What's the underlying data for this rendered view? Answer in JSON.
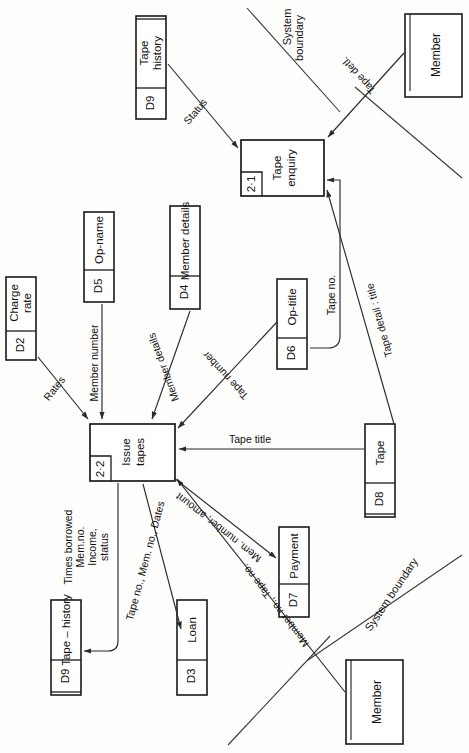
{
  "diagram": {
    "type": "data-flow-diagram",
    "orientation": "rotated-90-clockwise",
    "title": "",
    "colors": {
      "background": "#fdfdfc",
      "stroke": "#1a1a1a",
      "flow": "#2b2b2b",
      "text": "#111111"
    }
  },
  "processes": [
    {
      "id": "2·1",
      "name_line1": "Tape",
      "name_line2": "enquiry"
    },
    {
      "id": "2·2",
      "name_line1": "Issue",
      "name_line2": "tapes"
    }
  ],
  "data_stores": [
    {
      "id": "D9",
      "name_line1": "Tape",
      "name_line2": "history"
    },
    {
      "id": "D2",
      "name_line1": "Charge",
      "name_line2": "rate"
    },
    {
      "id": "D5",
      "name_line1": "Op-name",
      "name_line2": ""
    },
    {
      "id": "D4",
      "name_line1": "Member details",
      "name_line2": ""
    },
    {
      "id": "D6",
      "name_line1": "Op-title",
      "name_line2": ""
    },
    {
      "id": "D8",
      "name_line1": "Tape",
      "name_line2": ""
    },
    {
      "id": "D9",
      "name_line1": "Tape – history",
      "name_line2": ""
    },
    {
      "id": "D3",
      "name_line1": "Loan",
      "name_line2": ""
    },
    {
      "id": "D7",
      "name_line1": "Payment",
      "name_line2": ""
    }
  ],
  "external_entities": [
    {
      "name": "Member"
    },
    {
      "name": "Member"
    }
  ],
  "flows": [
    {
      "label": "Status"
    },
    {
      "label": "Tape detl."
    },
    {
      "label": "Tape no."
    },
    {
      "label": "Tape detail : title"
    },
    {
      "label": "Rates"
    },
    {
      "label": "Member number"
    },
    {
      "label": "Member details"
    },
    {
      "label": "Tape number"
    },
    {
      "label": "Tape title"
    },
    {
      "label": "Times borrowed"
    },
    {
      "label": "Mem.no."
    },
    {
      "label": "Income,"
    },
    {
      "label": "status"
    },
    {
      "label": "Tape no., Mem. no., Dates"
    },
    {
      "label": "Mem. number, amount"
    },
    {
      "label": "Member no., Tape no."
    }
  ],
  "boundaries": [
    {
      "label_line1": "System",
      "label_line2": "boundary"
    },
    {
      "label_line1": "System boundary",
      "label_line2": ""
    }
  ]
}
